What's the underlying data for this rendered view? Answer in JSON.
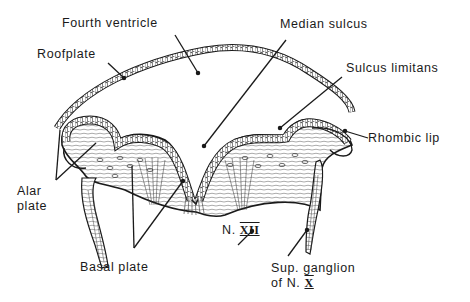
{
  "figure": {
    "type": "anatomical cross-section",
    "line_color": "#1a1a1a",
    "background": "#ffffff"
  },
  "labels": {
    "fourth_ventricle": "Fourth ventricle",
    "roofplate": "Roofplate",
    "median_sulcus": "Median sulcus",
    "sulcus_limitans": "Sulcus limitans",
    "rhombic_lip": "Rhombic lip",
    "alar_plate_line1": "Alar",
    "alar_plate_line2": "plate",
    "basal_plate": "Basal plate",
    "n_xii_prefix": "N.",
    "n_xii_numeral": "XII",
    "sup_ganglion_line1": "Sup. ganglion",
    "sup_ganglion_line2_prefix": "of N.",
    "sup_ganglion_line2_numeral": "X"
  }
}
